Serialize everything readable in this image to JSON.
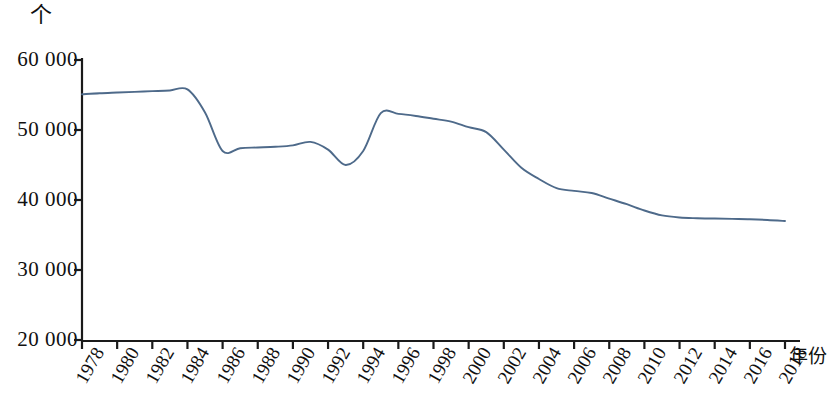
{
  "chart_data": {
    "type": "line",
    "title": "",
    "subtitle": "",
    "unit_label": "个",
    "xlabel": "年份",
    "ylabel": "",
    "ylim": [
      20000,
      60000
    ],
    "xlim": [
      1978,
      2018
    ],
    "grid": false,
    "legend": null,
    "legend_position": "none",
    "line_color": "#4e6a8a",
    "axis_color": "#1a1a1a",
    "y_ticks": [
      20000,
      30000,
      40000,
      50000,
      60000
    ],
    "y_tick_labels": [
      "20 000",
      "30 000",
      "40 000",
      "50 000",
      "60 000"
    ],
    "x_ticks": [
      1978,
      1980,
      1982,
      1984,
      1986,
      1988,
      1990,
      1992,
      1994,
      1996,
      1998,
      2000,
      2002,
      2004,
      2006,
      2008,
      2010,
      2012,
      2014,
      2016,
      2018
    ],
    "x_tick_labels": [
      "1978",
      "1980",
      "1982",
      "1984",
      "1986",
      "1988",
      "1990",
      "1992",
      "1994",
      "1996",
      "1998",
      "2000",
      "2002",
      "2004",
      "2006",
      "2008",
      "2010",
      "2012",
      "2014",
      "2016",
      "2018"
    ],
    "x": [
      1978,
      1979,
      1980,
      1981,
      1982,
      1983,
      1984,
      1985,
      1986,
      1987,
      1988,
      1989,
      1990,
      1991,
      1992,
      1993,
      1994,
      1995,
      1996,
      1997,
      1998,
      1999,
      2000,
      2001,
      2002,
      2003,
      2004,
      2005,
      2006,
      2007,
      2008,
      2009,
      2010,
      2011,
      2012,
      2013,
      2014,
      2015,
      2016,
      2017,
      2018
    ],
    "values": [
      55100,
      55250,
      55350,
      55450,
      55550,
      55650,
      55800,
      52500,
      47000,
      47400,
      47500,
      47600,
      47800,
      48300,
      47200,
      45000,
      47000,
      52400,
      52300,
      52000,
      51600,
      51200,
      50400,
      49700,
      47200,
      44600,
      43000,
      41700,
      41300,
      41000,
      40200,
      39400,
      38500,
      37800,
      37500,
      37400,
      37350,
      37300,
      37250,
      37150,
      37000
    ]
  }
}
